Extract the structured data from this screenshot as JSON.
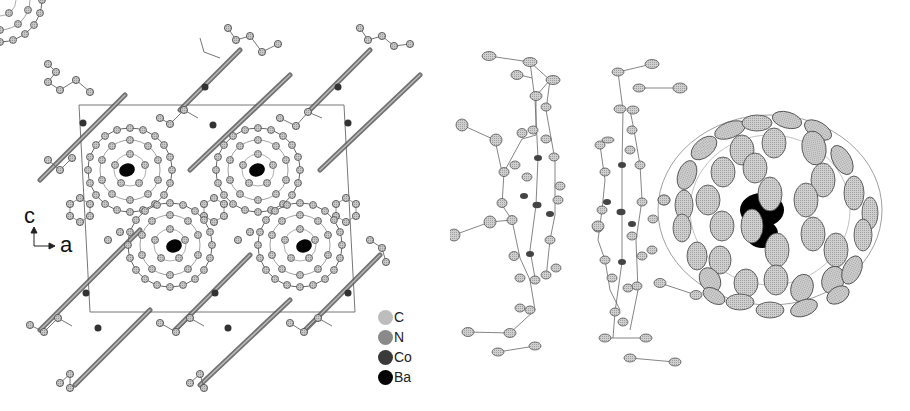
{
  "figure": {
    "left_panel": {
      "description": "Crystal packing view along b-axis: unit cell with four endohedral fullerenes and cobalt porphyrin chains",
      "axes": {
        "vertical": "c",
        "horizontal": "a"
      },
      "legend": [
        {
          "label": "C",
          "color": "#bdbdbd"
        },
        {
          "label": "N",
          "color": "#8a8a8a"
        },
        {
          "label": "Co",
          "color": "#3a3a3a"
        },
        {
          "label": "Ba",
          "color": "#050505"
        }
      ]
    },
    "right_panel": {
      "description": "Thermal ellipsoid plot: two porphyrin molecules and one fullerene cage with disordered Ba atom inside"
    },
    "colors": {
      "carbon": "#c4c4c4",
      "nitrogen": "#8c8c8c",
      "cobalt": "#333333",
      "barium": "#000000",
      "bond": "#555555",
      "cell": "#777777"
    }
  }
}
